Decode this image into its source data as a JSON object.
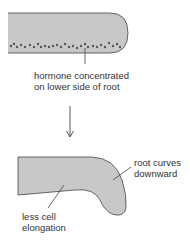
{
  "diagram": {
    "top_label": [
      "hormone concentrated",
      "on lower side of root"
    ],
    "right_label": [
      "root curves",
      "downward"
    ],
    "bottom_label": [
      "less cell",
      "elongation"
    ],
    "colors": {
      "root_fill": "#c8c8c8",
      "root_stroke": "#444444",
      "dot": "#555555",
      "text": "#333333"
    }
  }
}
